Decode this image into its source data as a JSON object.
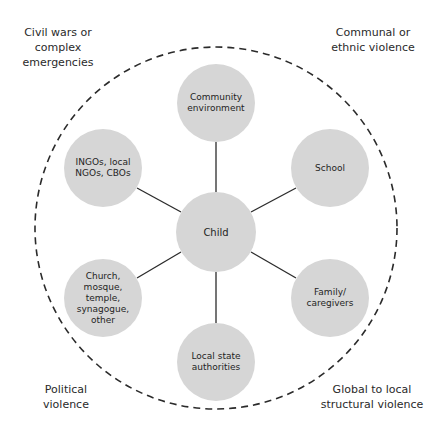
{
  "diagram": {
    "type": "hub-and-spoke",
    "outer_boundary": {
      "style": "dashed",
      "color": "#2b2b2b",
      "cx": 216,
      "cy": 228,
      "r": 181
    },
    "node_fill": "#d6d6d6",
    "edge_color": "#2b2b2b",
    "center": {
      "id": "child",
      "label": "Child",
      "cx": 216,
      "cy": 232,
      "r": 40
    },
    "nodes": [
      {
        "id": "community",
        "label": "Community\nenvironment",
        "cx": 216,
        "cy": 103,
        "r": 39
      },
      {
        "id": "school",
        "label": "School",
        "cx": 330,
        "cy": 168,
        "r": 39
      },
      {
        "id": "family",
        "label": "Family/\ncaregivers",
        "cx": 330,
        "cy": 298,
        "r": 39
      },
      {
        "id": "local-state",
        "label": "Local state\nauthorities",
        "cx": 216,
        "cy": 362,
        "r": 39
      },
      {
        "id": "religious",
        "label": "Church,\nmosque,\ntemple,\nsynagogue,\nother",
        "cx": 103,
        "cy": 298,
        "r": 39
      },
      {
        "id": "ngos",
        "label": "INGOs, local\nNGOs, CBOs",
        "cx": 103,
        "cy": 168,
        "r": 39
      }
    ],
    "edges": [
      {
        "from": "child",
        "to": "community"
      },
      {
        "from": "child",
        "to": "school"
      },
      {
        "from": "child",
        "to": "family"
      },
      {
        "from": "child",
        "to": "local-state"
      },
      {
        "from": "child",
        "to": "religious"
      },
      {
        "from": "child",
        "to": "ngos"
      }
    ],
    "corner_labels": {
      "top_left": "Civil wars or\ncomplex emergencies",
      "top_right": "Communal or\nethnic violence",
      "bottom_left": "Political\nviolence",
      "bottom_right": "Global to local\nstructural violence"
    }
  }
}
